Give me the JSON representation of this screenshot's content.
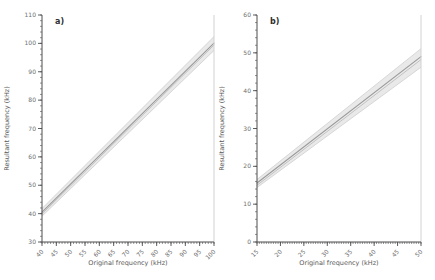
{
  "figure": {
    "background": "#ffffff",
    "axis_color": "#4d4d4d",
    "tick_label_color": "#6e6e6e",
    "axis_title_color": "#5a5a5a",
    "panel_label_color": "#2f2f2f",
    "frame_right_color": "#d2d2d2"
  },
  "chart_data": [
    {
      "type": "line",
      "panel_label": "a)",
      "title": "",
      "xlabel": "Original frequency (kHz)",
      "ylabel": "Resultant frequency (kHz)",
      "xlim": [
        40,
        100
      ],
      "ylim": [
        30,
        110
      ],
      "x_ticks": [
        40,
        45,
        50,
        55,
        60,
        65,
        70,
        75,
        80,
        85,
        90,
        95,
        100
      ],
      "y_ticks": [
        30,
        40,
        50,
        60,
        70,
        80,
        90,
        100,
        110
      ],
      "x_minor_step": 1,
      "y_minor_step": 2,
      "grid": false,
      "legend": "none",
      "series": [
        {
          "name": "regression-line",
          "x": [
            40,
            100
          ],
          "y": [
            40.5,
            100.1
          ],
          "color": "#9a9a9a",
          "width": 1.1
        },
        {
          "name": "reference-line",
          "x": [
            40,
            100
          ],
          "y": [
            39.9,
            99.4
          ],
          "color": "#b7b7b7",
          "width": 0.8
        }
      ],
      "band": {
        "name": "confidence-band",
        "x": [
          40,
          100
        ],
        "upper": [
          41.8,
          102.4
        ],
        "lower": [
          39.1,
          97.5
        ],
        "fill": "#e9e9e9",
        "edge": "#cfcfcf"
      }
    },
    {
      "type": "line",
      "panel_label": "b)",
      "title": "",
      "xlabel": "Original frequency (kHz)",
      "ylabel": "Resultant frequency (kHz)",
      "xlim": [
        15,
        50
      ],
      "ylim": [
        0,
        60
      ],
      "x_ticks": [
        15,
        20,
        25,
        30,
        35,
        40,
        45,
        50
      ],
      "y_ticks": [
        0,
        10,
        20,
        30,
        40,
        50,
        60
      ],
      "x_minor_step": 0.5,
      "y_minor_step": 2,
      "grid": false,
      "legend": "none",
      "series": [
        {
          "name": "regression-line",
          "x": [
            15,
            50
          ],
          "y": [
            15.6,
            49.0
          ],
          "color": "#9a9a9a",
          "width": 1.1
        },
        {
          "name": "reference-line",
          "x": [
            15,
            50
          ],
          "y": [
            15.0,
            48.2
          ],
          "color": "#b7b7b7",
          "width": 0.8
        }
      ],
      "band": {
        "name": "confidence-band",
        "x": [
          15,
          50
        ],
        "upper": [
          16.5,
          51.1
        ],
        "lower": [
          14.4,
          46.2
        ],
        "fill": "#e9e9e9",
        "edge": "#cfcfcf"
      }
    }
  ]
}
